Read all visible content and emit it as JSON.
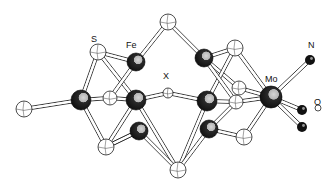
{
  "diagram": {
    "title": "",
    "labels": {
      "S": {
        "text": "S",
        "x": 91,
        "y": 35
      },
      "Fe": {
        "text": "Fe",
        "x": 126,
        "y": 41
      },
      "X": {
        "text": "X",
        "x": 163,
        "y": 72
      },
      "Mo": {
        "text": "Mo",
        "x": 265,
        "y": 75
      },
      "N": {
        "text": "N",
        "x": 308,
        "y": 41
      },
      "O": {
        "text": "O",
        "x": 314,
        "y": 98
      }
    },
    "colors": {
      "fe": "#1e1e1e",
      "fe_highlight": "#bdbdbd",
      "s": "#ffffff",
      "bond": "#222222"
    },
    "atoms": [
      {
        "id": "S1",
        "el": "S",
        "x": 98,
        "y": 52,
        "r": 8
      },
      {
        "id": "S2",
        "el": "S",
        "x": 168,
        "y": 22,
        "r": 8
      },
      {
        "id": "S3",
        "el": "S",
        "x": 235,
        "y": 48,
        "r": 8
      },
      {
        "id": "S4",
        "el": "S",
        "x": 24,
        "y": 109,
        "r": 8
      },
      {
        "id": "S5",
        "el": "S",
        "x": 110,
        "y": 98,
        "r": 7
      },
      {
        "id": "S6",
        "el": "S",
        "x": 239,
        "y": 88,
        "r": 7
      },
      {
        "id": "S7",
        "el": "S",
        "x": 106,
        "y": 147,
        "r": 8
      },
      {
        "id": "S8",
        "el": "S",
        "x": 178,
        "y": 170,
        "r": 8
      },
      {
        "id": "S9",
        "el": "S",
        "x": 244,
        "y": 137,
        "r": 8
      },
      {
        "id": "S10",
        "el": "S",
        "x": 236,
        "y": 102,
        "r": 7
      },
      {
        "id": "Fe1",
        "el": "Fe",
        "x": 136,
        "y": 62,
        "r": 9
      },
      {
        "id": "Fe2",
        "el": "Fe",
        "x": 81,
        "y": 100,
        "r": 10
      },
      {
        "id": "Fe3",
        "el": "Fe",
        "x": 136,
        "y": 100,
        "r": 10
      },
      {
        "id": "Fe4",
        "el": "Fe",
        "x": 204,
        "y": 58,
        "r": 9
      },
      {
        "id": "Fe5",
        "el": "Fe",
        "x": 207,
        "y": 101,
        "r": 10
      },
      {
        "id": "Fe6",
        "el": "Fe",
        "x": 139,
        "y": 131,
        "r": 9
      },
      {
        "id": "Fe7",
        "el": "Fe",
        "x": 209,
        "y": 129,
        "r": 9
      },
      {
        "id": "X",
        "el": "X",
        "x": 168,
        "y": 93,
        "r": 5
      },
      {
        "id": "Mo",
        "el": "Mo",
        "x": 271,
        "y": 97,
        "r": 11
      },
      {
        "id": "N",
        "el": "N",
        "x": 310,
        "y": 60,
        "r": 5
      },
      {
        "id": "O1",
        "el": "O",
        "x": 302,
        "y": 110,
        "r": 5
      },
      {
        "id": "O2",
        "el": "O",
        "x": 302,
        "y": 127,
        "r": 5
      },
      {
        "id": "H",
        "el": "H",
        "x": 318,
        "y": 108,
        "r": 3
      }
    ],
    "bonds": [
      [
        "S4",
        "Fe2"
      ],
      [
        "Fe2",
        "S1"
      ],
      [
        "Fe2",
        "S7"
      ],
      [
        "Fe2",
        "S5"
      ],
      [
        "S1",
        "Fe1"
      ],
      [
        "S1",
        "Fe3"
      ],
      [
        "S5",
        "Fe3"
      ],
      [
        "S5",
        "Fe1"
      ],
      [
        "Fe1",
        "S2"
      ],
      [
        "S2",
        "Fe4"
      ],
      [
        "Fe3",
        "X"
      ],
      [
        "X",
        "Fe5"
      ],
      [
        "Fe3",
        "S7"
      ],
      [
        "S7",
        "Fe6"
      ],
      [
        "Fe3",
        "S8"
      ],
      [
        "Fe6",
        "S8"
      ],
      [
        "Fe4",
        "S3"
      ],
      [
        "Fe4",
        "S6"
      ],
      [
        "S3",
        "Fe5"
      ],
      [
        "S3",
        "Mo"
      ],
      [
        "Fe5",
        "S10"
      ],
      [
        "S6",
        "Mo"
      ],
      [
        "Fe5",
        "S8"
      ],
      [
        "Fe7",
        "S9"
      ],
      [
        "Fe7",
        "S10"
      ],
      [
        "S9",
        "Mo"
      ],
      [
        "S10",
        "Mo"
      ],
      [
        "Mo",
        "N"
      ],
      [
        "Mo",
        "O1"
      ],
      [
        "Mo",
        "O2"
      ],
      [
        "Fe6",
        "S7"
      ],
      [
        "Fe4",
        "S10"
      ],
      [
        "Fe7",
        "S8"
      ]
    ]
  }
}
